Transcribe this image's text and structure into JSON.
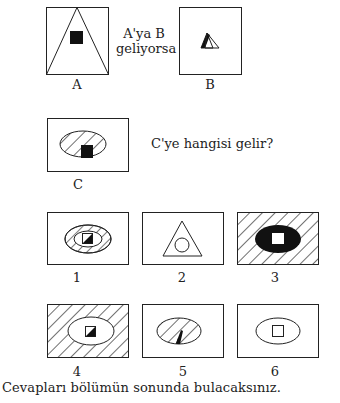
{
  "prompt": {
    "line1": "A'ya B",
    "line2": "geliyorsa"
  },
  "question": "C'ye hangisi gelir?",
  "footer": "Cevapları bölümün sonunda bulacaksınız.",
  "colors": {
    "ink": "#222222",
    "fill": "#111111",
    "background": "#ffffff"
  },
  "figures": {
    "A": {
      "label": "A",
      "description": "Tall rectangle containing a triangle spanning the full box with a black square inside"
    },
    "B": {
      "label": "B",
      "description": "Tall rectangle containing a small triangle with its left edge filled black"
    },
    "C": {
      "label": "C",
      "description": "Wide rectangle with a hatched ellipse and a black square at the bottom center"
    }
  },
  "options": [
    {
      "label": "1",
      "description": "Ellipse with hatched ring around inner ellipse containing a half-black square"
    },
    {
      "label": "2",
      "description": "Triangle with a circle inside"
    },
    {
      "label": "3",
      "description": "Hatched background with black ellipse containing a white square"
    },
    {
      "label": "4",
      "description": "Hatched background with white ellipse containing a half-black square"
    },
    {
      "label": "5",
      "description": "Hatched ellipse with a black thick-edged triangle at the bottom"
    },
    {
      "label": "6",
      "description": "White ellipse containing a white square"
    }
  ]
}
